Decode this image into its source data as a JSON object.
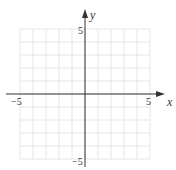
{
  "chart_data": {
    "type": "scatter",
    "title": "",
    "xlabel": "x",
    "ylabel": "y",
    "xlim": [
      -5,
      5
    ],
    "ylim": [
      -5,
      5
    ],
    "grid": true,
    "grid_step": 1,
    "x_tick_labels": [
      "-5",
      "5"
    ],
    "y_tick_labels": [
      "5",
      "-5"
    ],
    "series": []
  },
  "labels": {
    "x_axis": "x",
    "y_axis": "y",
    "x_min": "−5",
    "x_max": "5",
    "y_max": "5",
    "y_min": "−5"
  },
  "colors": {
    "grid": "#e6e6e6",
    "axis": "#333333"
  }
}
